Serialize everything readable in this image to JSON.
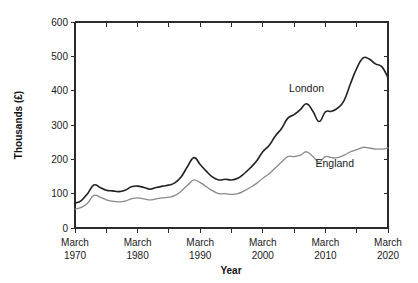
{
  "chart_data": {
    "type": "line",
    "title": "",
    "xlabel": "Year",
    "ylabel": "Thousands (£)",
    "ylim": [
      0,
      600
    ],
    "xlim": [
      1970,
      2020
    ],
    "grid": false,
    "legend_position": "inline-annotation",
    "y_ticks": [
      "0",
      "100",
      "200",
      "300",
      "400",
      "500",
      "600"
    ],
    "y_tick_values": [
      0,
      100,
      200,
      300,
      400,
      500,
      600
    ],
    "x_ticks": [
      {
        "line1": "March",
        "line2": "1970",
        "value": 1970
      },
      {
        "line1": "March",
        "line2": "1980",
        "value": 1980
      },
      {
        "line1": "March",
        "line2": "1990",
        "value": 1990
      },
      {
        "line1": "March",
        "line2": "2000",
        "value": 2000
      },
      {
        "line1": "March",
        "line2": "2010",
        "value": 2010
      },
      {
        "line1": "March",
        "line2": "2020",
        "value": 2020
      }
    ],
    "x_minor_tick_values": [
      1975,
      1985,
      1995,
      2005,
      2015
    ],
    "series": [
      {
        "name": "London",
        "color": "#222222",
        "width": 1.6,
        "label_x": 2007.0,
        "label_y": 395,
        "x": [
          1970,
          1971,
          1972,
          1973,
          1974,
          1975,
          1976,
          1977,
          1978,
          1979,
          1980,
          1981,
          1982,
          1983,
          1984,
          1985,
          1986,
          1987,
          1988,
          1989,
          1990,
          1991,
          1992,
          1993,
          1994,
          1995,
          1996,
          1997,
          1998,
          1999,
          2000,
          2001,
          2002,
          2003,
          2004,
          2005,
          2006,
          2007,
          2008,
          2009,
          2010,
          2011,
          2012,
          2013,
          2014,
          2015,
          2016,
          2017,
          2018,
          2019,
          2020
        ],
        "values": [
          72,
          80,
          100,
          125,
          118,
          110,
          108,
          106,
          110,
          120,
          122,
          118,
          113,
          118,
          122,
          125,
          132,
          150,
          180,
          205,
          185,
          165,
          148,
          140,
          142,
          140,
          145,
          158,
          175,
          195,
          222,
          240,
          268,
          290,
          320,
          330,
          345,
          362,
          340,
          310,
          338,
          340,
          350,
          372,
          420,
          465,
          495,
          492,
          478,
          470,
          438
        ]
      },
      {
        "name": "England",
        "color": "#8a8a8a",
        "width": 1.3,
        "label_x": 2011.5,
        "label_y": 178,
        "x": [
          1970,
          1971,
          1972,
          1973,
          1974,
          1975,
          1976,
          1977,
          1978,
          1979,
          1980,
          1981,
          1982,
          1983,
          1984,
          1985,
          1986,
          1987,
          1988,
          1989,
          1990,
          1991,
          1992,
          1993,
          1994,
          1995,
          1996,
          1997,
          1998,
          1999,
          2000,
          2001,
          2002,
          2003,
          2004,
          2005,
          2006,
          2007,
          2008,
          2009,
          2010,
          2011,
          2012,
          2013,
          2014,
          2015,
          2016,
          2017,
          2018,
          2019,
          2020
        ],
        "values": [
          55,
          60,
          72,
          95,
          90,
          82,
          78,
          76,
          78,
          85,
          88,
          85,
          82,
          85,
          88,
          90,
          95,
          108,
          125,
          140,
          132,
          120,
          108,
          100,
          100,
          98,
          100,
          108,
          118,
          130,
          145,
          158,
          175,
          192,
          208,
          208,
          212,
          222,
          208,
          192,
          208,
          205,
          205,
          212,
          222,
          228,
          235,
          233,
          230,
          230,
          233
        ]
      }
    ]
  },
  "plot_geometry": {
    "left": 75,
    "right": 388,
    "top": 22,
    "bottom": 228
  }
}
